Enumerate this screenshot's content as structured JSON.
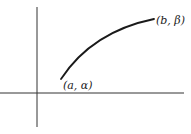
{
  "diagram": {
    "axes": {
      "color": "#333333",
      "x_axis": {
        "x1": 0,
        "y1": 93,
        "x2": 184,
        "y2": 93
      },
      "y_axis": {
        "x1": 37,
        "y1": 7,
        "x2": 37,
        "y2": 127
      }
    },
    "curve": {
      "color": "#1a1a1a",
      "path": "M61,79 C80,50 110,28 154,19"
    },
    "points": [
      {
        "label": "(a, α)",
        "x": 63,
        "y": 89
      },
      {
        "label": "(b, β)",
        "x": 156,
        "y": 24
      }
    ]
  }
}
